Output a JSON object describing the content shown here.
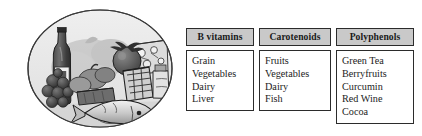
{
  "figure": {
    "illustration": {
      "name": "food-still-life-oval",
      "description": "Grayscale still-life of foods inside an oval: wine bottle, grapes, tomato, vegetables, bread, cheese, jar and a fish",
      "oval_fill": "#e9e9e9",
      "oval_stroke": "#3a3a3a",
      "items_depicted": [
        "wine-bottle",
        "grapes",
        "tomato",
        "vegetables",
        "bread-loaf",
        "cheese-wedge",
        "jar",
        "fish"
      ]
    },
    "table": {
      "header_fill": "#c9c9c9",
      "border_color": "#2b2b2b",
      "columns": [
        {
          "header": "B vitamins",
          "items": [
            "Grain",
            "Vegetables",
            "Dairy",
            "Liver"
          ]
        },
        {
          "header": "Carotenoids",
          "items": [
            "Fruits",
            "Vegetables",
            "Dairy",
            "Fish"
          ]
        },
        {
          "header": "Polyphenols",
          "items": [
            "Green Tea",
            "Berryfruits",
            "Curcumin",
            "Red Wine",
            "Cocoa"
          ]
        }
      ]
    }
  }
}
